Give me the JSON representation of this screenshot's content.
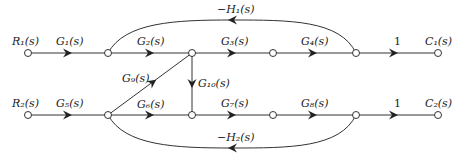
{
  "diagram": {
    "type": "signal-flow-graph",
    "colors": {
      "line": "#333333",
      "text": "#222222",
      "background": "#ffffff"
    },
    "inputs": [
      {
        "id": "R1",
        "label": "R₁(s)"
      },
      {
        "id": "R2",
        "label": "R₂(s)"
      }
    ],
    "outputs": [
      {
        "id": "C1",
        "label": "C₁(s)"
      },
      {
        "id": "C2",
        "label": "C₂(s)"
      }
    ],
    "branches": {
      "G1": "G₁(s)",
      "G2": "G₂(s)",
      "G3": "G₃(s)",
      "G4": "G₄(s)",
      "G5": "G₅(s)",
      "G6": "G₆(s)",
      "G7": "G₇(s)",
      "G8": "G₈(s)",
      "G9": "G₉(s)",
      "G10": "G₁₀(s)",
      "unity_top": "1",
      "unity_bottom": "1"
    },
    "feedback": {
      "H1": "−H₁(s)",
      "H2": "−H₂(s)"
    }
  }
}
